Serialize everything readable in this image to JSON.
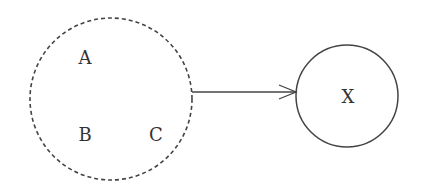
{
  "diagram": {
    "group": {
      "style": "dashed",
      "members": [
        {
          "label": "A",
          "x": 85,
          "y": 60
        },
        {
          "label": "B",
          "x": 85,
          "y": 135
        },
        {
          "label": "C",
          "x": 156,
          "y": 135
        }
      ]
    },
    "target": {
      "label": "X",
      "style": "solid"
    },
    "edge": {
      "from": "group",
      "to": "X",
      "style": "arrow"
    },
    "colors": {
      "stroke": "#444444",
      "text": "#333333",
      "background": "#ffffff"
    }
  }
}
